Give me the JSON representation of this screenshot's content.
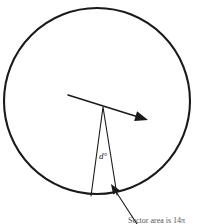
{
  "figure": {
    "kind": "geometry-diagram",
    "width": 201,
    "height": 224,
    "background_color": "#ffffff",
    "stroke_color": "#1a1a1a",
    "labels": {
      "angle": "d°",
      "sector_caption": "Sector area is 14π"
    },
    "icon_names": {
      "circle": "circle-outline-icon",
      "radius_arrow": "radius-arrow-icon",
      "sector": "sector-wedge-icon",
      "callout": "callout-arrow-icon"
    }
  },
  "chart_data": {
    "type": "diagram",
    "title": "",
    "circle": {
      "center_x": 97,
      "center_y": 101,
      "radius": 93,
      "stroke": "#1a1a1a",
      "stroke_width": 2.1,
      "fill": "none"
    },
    "radius_arrow": {
      "start_x": 68,
      "start_y": 95,
      "end_x": 148,
      "end_y": 120,
      "stroke_width": 1.5,
      "arrowhead": true
    },
    "sector": {
      "apex_x": 103,
      "apex_y": 107,
      "base_left_x": 91,
      "base_left_y": 196,
      "base_right_x": 117,
      "base_right_y": 195,
      "stroke_width": 1.1,
      "angle_degrees_label": "d°",
      "angle_label_x": 99,
      "angle_label_y": 152
    },
    "callout": {
      "tail_x": 137,
      "tail_y": 224,
      "tip_x": 111,
      "tip_y": 184,
      "stroke_width": 1.1,
      "arrowhead": true
    },
    "caption": {
      "text": "Sector area is 14π",
      "x": 128,
      "y": 216,
      "clipped_at_bottom": true
    }
  }
}
